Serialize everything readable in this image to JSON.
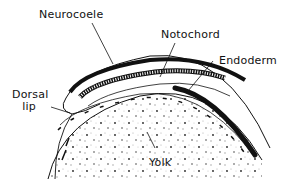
{
  "diagram": {
    "labels": {
      "neurocoele": "Neurocoele",
      "notochord": "Notochord",
      "endoderm": "Endoderm",
      "dorsal_lip_line1": "Dorsal",
      "dorsal_lip_line2": "lip",
      "yolk": "Yolk"
    },
    "colors": {
      "ink": "#111111",
      "background": "#ffffff",
      "stipple": "#888888"
    }
  }
}
